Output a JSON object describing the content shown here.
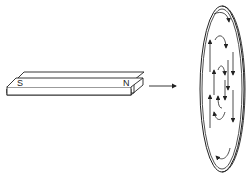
{
  "diagram": {
    "magnet": {
      "south_label": "S",
      "north_label": "N"
    },
    "arrow": "motion-direction-arrow",
    "disc": {
      "description": "conducting disc with circulating eddy currents",
      "current_loops": 3
    },
    "colors": {
      "stroke": "#222222",
      "background": "#ffffff"
    }
  }
}
